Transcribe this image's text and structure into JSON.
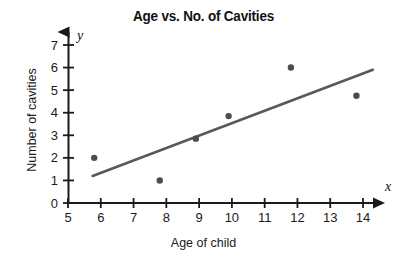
{
  "chart_data": {
    "type": "scatter",
    "title": "Age vs. No. of Cavities",
    "xlabel": "Age of child",
    "ylabel": "Number of cavities",
    "x_axis_symbol": "x",
    "y_axis_symbol": "y",
    "xlim": [
      5,
      14.5
    ],
    "ylim": [
      0,
      7.3
    ],
    "xticks": [
      5,
      6,
      7,
      8,
      9,
      10,
      11,
      12,
      13,
      14
    ],
    "yticks": [
      0,
      1,
      2,
      3,
      4,
      5,
      6,
      7
    ],
    "xtick_labels": [
      "5",
      "6",
      "7",
      "8",
      "9",
      "10",
      "11",
      "12",
      "13",
      "14"
    ],
    "ytick_labels": [
      "0",
      "1",
      "2",
      "3",
      "4",
      "5",
      "6",
      "7"
    ],
    "grid": false,
    "legend": false,
    "point_color": "#4d4d4d",
    "line_color": "#595959",
    "axis_color": "#1a1a1a",
    "points": [
      {
        "x": 5.8,
        "y": 2.0
      },
      {
        "x": 7.8,
        "y": 1.0
      },
      {
        "x": 8.9,
        "y": 2.85
      },
      {
        "x": 9.9,
        "y": 3.85
      },
      {
        "x": 11.8,
        "y": 6.0
      },
      {
        "x": 13.8,
        "y": 4.75
      }
    ],
    "trend_line": {
      "x1": 5.75,
      "y1": 1.2,
      "x2": 14.3,
      "y2": 5.9
    }
  }
}
